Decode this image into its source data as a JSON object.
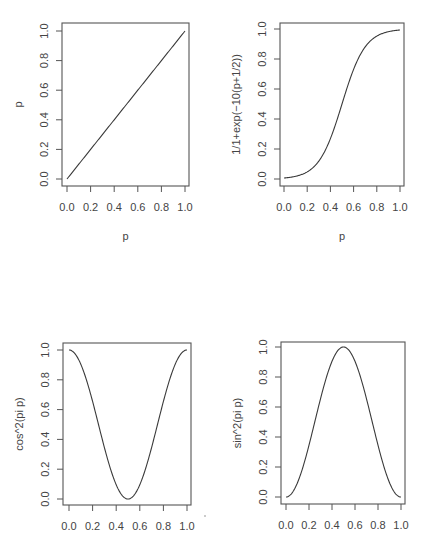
{
  "chart_data": [
    {
      "type": "line",
      "id": "identity",
      "title": "",
      "xlabel": "p",
      "ylabel": "p",
      "formula": "p",
      "xlim": [
        0,
        1
      ],
      "ylim": [
        0,
        1
      ],
      "xticks": [
        "0.0",
        "0.2",
        "0.4",
        "0.6",
        "0.8",
        "1.0"
      ],
      "yticks": [
        "0.0",
        "0.2",
        "0.4",
        "0.6",
        "0.8",
        "1.0"
      ],
      "grid": false,
      "x": [
        0.0,
        0.1,
        0.2,
        0.3,
        0.4,
        0.5,
        0.6,
        0.7,
        0.8,
        0.9,
        1.0
      ],
      "y": [
        0.0,
        0.1,
        0.2,
        0.3,
        0.4,
        0.5,
        0.6,
        0.7,
        0.8,
        0.9,
        1.0
      ]
    },
    {
      "type": "line",
      "id": "logistic",
      "title": "",
      "xlabel": "p",
      "ylabel": "1/1+exp(−10(p+1/2))",
      "formula": "1/(1+exp(-10(p-1/2)))",
      "xlim": [
        0,
        1
      ],
      "ylim": [
        0,
        1
      ],
      "xticks": [
        "0.0",
        "0.2",
        "0.4",
        "0.6",
        "0.8",
        "1.0"
      ],
      "yticks": [
        "0.0",
        "0.2",
        "0.4",
        "0.6",
        "0.8",
        "1.0"
      ],
      "grid": false,
      "x": [
        0.0,
        0.1,
        0.2,
        0.3,
        0.4,
        0.5,
        0.6,
        0.7,
        0.8,
        0.9,
        1.0
      ],
      "y": [
        0.007,
        0.018,
        0.047,
        0.119,
        0.269,
        0.5,
        0.731,
        0.881,
        0.953,
        0.982,
        0.993
      ]
    },
    {
      "type": "line",
      "id": "cos2",
      "title": "",
      "xlabel": "",
      "ylabel": "cos^2(pi p)",
      "formula": "cos(pi*p)^2",
      "xlim": [
        0,
        1
      ],
      "ylim": [
        0,
        1
      ],
      "xticks": [
        "0.0",
        "0.2",
        "0.4",
        "0.6",
        "0.8",
        "1.0"
      ],
      "yticks": [
        "0.0",
        "0.2",
        "0.4",
        "0.6",
        "0.8",
        "1.0"
      ],
      "grid": false,
      "x": [
        0.0,
        0.1,
        0.2,
        0.3,
        0.4,
        0.5,
        0.6,
        0.7,
        0.8,
        0.9,
        1.0
      ],
      "y": [
        1.0,
        0.905,
        0.655,
        0.345,
        0.095,
        0.0,
        0.095,
        0.345,
        0.655,
        0.905,
        1.0
      ]
    },
    {
      "type": "line",
      "id": "sin2",
      "title": "",
      "xlabel": "",
      "ylabel": "sin^2(pi p)",
      "formula": "sin(pi*p)^2",
      "xlim": [
        0,
        1
      ],
      "ylim": [
        0,
        1
      ],
      "xticks": [
        "0.0",
        "0.2",
        "0.4",
        "0.6",
        "0.8",
        "1.0"
      ],
      "yticks": [
        "0.0",
        "0.2",
        "0.4",
        "0.6",
        "0.8",
        "1.0"
      ],
      "grid": false,
      "x": [
        0.0,
        0.1,
        0.2,
        0.3,
        0.4,
        0.5,
        0.6,
        0.7,
        0.8,
        0.9,
        1.0
      ],
      "y": [
        0.0,
        0.095,
        0.345,
        0.655,
        0.905,
        1.0,
        0.905,
        0.655,
        0.345,
        0.095,
        0.0
      ]
    }
  ],
  "panels": [
    {
      "box": [
        62,
        23,
        189,
        186
      ],
      "x0": 67,
      "x1": 185,
      "y0": 179,
      "y1": 31,
      "xlab_y": 240
    },
    {
      "box": [
        280,
        23,
        404,
        186
      ],
      "x0": 284,
      "x1": 400,
      "y0": 179,
      "y1": 29,
      "xlab_y": 240
    },
    {
      "box": [
        63,
        343,
        191,
        505
      ],
      "x0": 69,
      "x1": 187,
      "y0": 499,
      "y1": 350,
      "xlab_y": null
    },
    {
      "box": [
        281,
        342,
        405,
        504
      ],
      "x0": 286,
      "x1": 401,
      "y0": 497,
      "y1": 347,
      "xlab_y": null
    }
  ],
  "style": {
    "line_color": "#3a3a3a",
    "axis_color": "#555555",
    "label_color": "#444444"
  }
}
